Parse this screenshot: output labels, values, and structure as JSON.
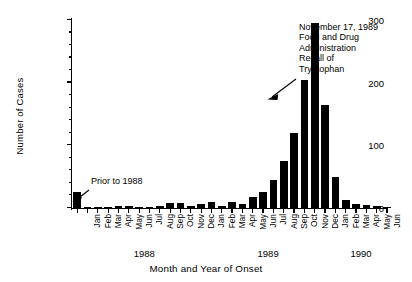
{
  "chart_data": {
    "type": "bar",
    "title": "",
    "xlabel": "Month and Year of Onset",
    "ylabel": "Number of Cases",
    "ylim": [
      0,
      300
    ],
    "yticks_major": [
      0,
      100,
      200,
      300
    ],
    "ytick_labels": [
      "0",
      "100",
      "200",
      "300"
    ],
    "ytick_minor_step": 20,
    "grid": false,
    "legend": "none",
    "categories": [
      "Prior to 1988",
      "Jan",
      "Feb",
      "Mar",
      "Apr",
      "May",
      "Jun",
      "Jul",
      "Aug",
      "Sep",
      "Oct",
      "Nov",
      "Dec",
      "Jan",
      "Feb",
      "Mar",
      "Apr",
      "May",
      "Jun",
      "Jul",
      "Aug",
      "Sep",
      "Oct",
      "Nov",
      "Dec",
      "Jan",
      "Feb",
      "Mar",
      "Apr",
      "May",
      "Jun"
    ],
    "values": [
      25,
      2,
      1,
      2,
      3,
      3,
      1,
      2,
      3,
      8,
      8,
      4,
      7,
      9,
      4,
      10,
      6,
      18,
      25,
      45,
      75,
      120,
      205,
      295,
      165,
      50,
      12,
      6,
      5,
      3,
      2
    ],
    "years": [
      {
        "label": "1988",
        "span_start": 1,
        "span_end": 12
      },
      {
        "label": "1989",
        "span_start": 13,
        "span_end": 24
      },
      {
        "label": "1990",
        "span_start": 25,
        "span_end": 30
      }
    ],
    "annotations": [
      {
        "name": "prior-to-1988",
        "text": "Prior to 1988",
        "target_category": "Prior to 1988"
      },
      {
        "name": "fda-recall",
        "text": "November 17, 1989\nFood and Drug\nAdministration\nRecall of\nTryptophan",
        "target_category": "Nov 1989"
      }
    ],
    "colors": {
      "bar": "#000000",
      "axis": "#000000",
      "background": "#ffffff",
      "text": "#000000"
    }
  }
}
